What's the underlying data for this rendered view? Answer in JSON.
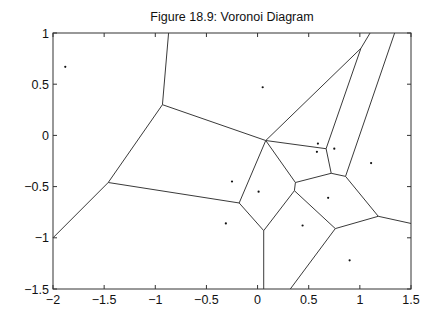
{
  "figure": {
    "title": "Figure 18.9: Voronoi Diagram"
  },
  "chart_data": {
    "type": "scatter",
    "title": "Figure 18.9: Voronoi Diagram",
    "xlabel": "",
    "ylabel": "",
    "xlim": [
      -2,
      1.5
    ],
    "ylim": [
      -1.5,
      1
    ],
    "grid": false,
    "legend": null,
    "x_ticks": [
      "-2",
      "-1.5",
      "-1",
      "-0.5",
      "0",
      "0.5",
      "1",
      "1.5"
    ],
    "y_ticks": [
      "1",
      "0.5",
      "0",
      "-0.5",
      "-1",
      "-1.5"
    ],
    "colors": {
      "axes": "#333333",
      "edges": "#3a3a3a",
      "points": "#111111"
    },
    "series": [
      {
        "name": "sites",
        "points": [
          [
            -1.88,
            0.67
          ],
          [
            0.05,
            0.47
          ],
          [
            0.59,
            -0.08
          ],
          [
            0.58,
            -0.16
          ],
          [
            0.75,
            -0.13
          ],
          [
            1.11,
            -0.27
          ],
          [
            -0.25,
            -0.45
          ],
          [
            0.01,
            -0.55
          ],
          [
            0.69,
            -0.61
          ],
          [
            -0.31,
            -0.86
          ],
          [
            0.44,
            -0.88
          ],
          [
            0.9,
            -1.22
          ]
        ]
      }
    ],
    "voronoi_vertices": {
      "A": [
        -0.93,
        0.3
      ],
      "B": [
        -1.46,
        -0.46
      ],
      "C": [
        -0.18,
        -0.66
      ],
      "D": [
        0.08,
        -0.05
      ],
      "E": [
        0.67,
        -0.13
      ],
      "F": [
        0.72,
        -0.37
      ],
      "G": [
        0.86,
        -0.4
      ],
      "H": [
        0.37,
        -0.46
      ],
      "I": [
        0.36,
        -0.54
      ],
      "J": [
        1.18,
        -0.79
      ],
      "K": [
        0.76,
        -0.91
      ],
      "L": [
        0.06,
        -0.93
      ],
      "M": [
        1.01,
        0.85
      ]
    },
    "voronoi_edges": [
      [
        [
          -0.87,
          1.0
        ],
        [
          -0.93,
          0.3
        ]
      ],
      [
        [
          -0.93,
          0.3
        ],
        [
          -1.46,
          -0.46
        ]
      ],
      [
        [
          -1.46,
          -0.46
        ],
        [
          -2.0,
          -1.0
        ]
      ],
      [
        [
          -1.46,
          -0.46
        ],
        [
          -0.18,
          -0.66
        ]
      ],
      [
        [
          -0.93,
          0.3
        ],
        [
          0.08,
          -0.05
        ]
      ],
      [
        [
          0.08,
          -0.05
        ],
        [
          1.01,
          0.85
        ]
      ],
      [
        [
          1.01,
          0.85
        ],
        [
          1.1,
          1.0
        ]
      ],
      [
        [
          1.01,
          0.85
        ],
        [
          0.67,
          -0.13
        ]
      ],
      [
        [
          0.08,
          -0.05
        ],
        [
          0.67,
          -0.13
        ]
      ],
      [
        [
          0.67,
          -0.13
        ],
        [
          0.72,
          -0.37
        ]
      ],
      [
        [
          0.72,
          -0.37
        ],
        [
          0.86,
          -0.4
        ]
      ],
      [
        [
          0.86,
          -0.4
        ],
        [
          1.34,
          1.0
        ]
      ],
      [
        [
          0.08,
          -0.05
        ],
        [
          0.37,
          -0.46
        ]
      ],
      [
        [
          0.37,
          -0.46
        ],
        [
          0.36,
          -0.54
        ]
      ],
      [
        [
          0.37,
          -0.46
        ],
        [
          0.72,
          -0.37
        ]
      ],
      [
        [
          0.08,
          -0.05
        ],
        [
          -0.18,
          -0.66
        ]
      ],
      [
        [
          -0.18,
          -0.66
        ],
        [
          0.06,
          -0.93
        ]
      ],
      [
        [
          0.06,
          -0.93
        ],
        [
          0.36,
          -0.54
        ]
      ],
      [
        [
          0.06,
          -0.93
        ],
        [
          0.06,
          -1.5
        ]
      ],
      [
        [
          0.36,
          -0.54
        ],
        [
          0.76,
          -0.91
        ]
      ],
      [
        [
          0.76,
          -0.91
        ],
        [
          1.18,
          -0.79
        ]
      ],
      [
        [
          0.76,
          -0.91
        ],
        [
          0.32,
          -1.5
        ]
      ],
      [
        [
          0.86,
          -0.4
        ],
        [
          1.18,
          -0.79
        ]
      ],
      [
        [
          1.18,
          -0.79
        ],
        [
          1.5,
          -0.86
        ]
      ]
    ]
  }
}
